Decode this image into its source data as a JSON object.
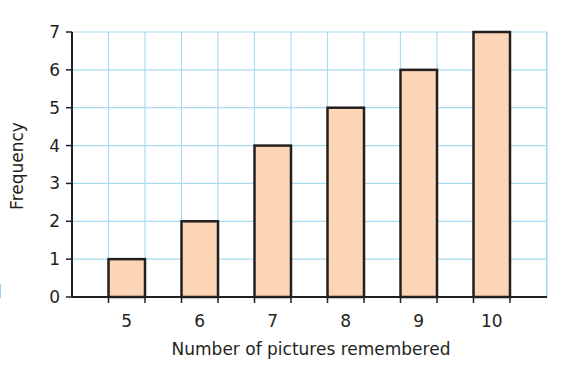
{
  "chart_data": {
    "type": "bar",
    "title": "",
    "xlabel": "Number of pictures remembered",
    "ylabel": "Frequency",
    "categories": [
      "5",
      "6",
      "7",
      "8",
      "9",
      "10"
    ],
    "values": [
      1,
      2,
      4,
      5,
      6,
      7
    ],
    "ylim": [
      0,
      7
    ],
    "yticks": [
      "0",
      "1",
      "2",
      "3",
      "4",
      "5",
      "6",
      "7"
    ],
    "grid": true,
    "legend": null
  },
  "colors": {
    "bar_fill": "#fbd5b5",
    "bar_stroke": "#231f20",
    "grid": "#a8dcef",
    "axis": "#231f20"
  },
  "fragment": "l"
}
